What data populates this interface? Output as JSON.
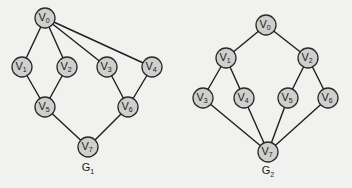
{
  "colors": {
    "background": "#f1f1ef",
    "node_fill": "#cfcfcd",
    "node_stroke": "#2a2a2a",
    "edge": "#1e1e1e"
  },
  "graphs": [
    {
      "id": "G1",
      "label": {
        "base": "G",
        "sub": "1",
        "x": 88,
        "y": 171
      },
      "nodes": [
        {
          "id": "V0",
          "base": "V",
          "sub": "0",
          "x": 45,
          "y": 18
        },
        {
          "id": "V1",
          "base": "V",
          "sub": "1",
          "x": 22,
          "y": 67
        },
        {
          "id": "V2",
          "base": "V",
          "sub": "2",
          "x": 67,
          "y": 67
        },
        {
          "id": "V3",
          "base": "V",
          "sub": "3",
          "x": 107,
          "y": 67
        },
        {
          "id": "V4",
          "base": "V",
          "sub": "4",
          "x": 152,
          "y": 67
        },
        {
          "id": "V5",
          "base": "V",
          "sub": "5",
          "x": 45,
          "y": 107
        },
        {
          "id": "V6",
          "base": "V",
          "sub": "6",
          "x": 128,
          "y": 107
        },
        {
          "id": "V7",
          "base": "V",
          "sub": "7",
          "x": 88,
          "y": 147
        }
      ],
      "edges": [
        [
          "V0",
          "V1"
        ],
        [
          "V0",
          "V2"
        ],
        [
          "V0",
          "V3"
        ],
        [
          "V0",
          "V4"
        ],
        [
          "V1",
          "V5"
        ],
        [
          "V2",
          "V5"
        ],
        [
          "V3",
          "V6"
        ],
        [
          "V4",
          "V6"
        ],
        [
          "V5",
          "V7"
        ],
        [
          "V6",
          "V7"
        ]
      ]
    },
    {
      "id": "G2",
      "label": {
        "base": "G",
        "sub": "2",
        "x": 268,
        "y": 174
      },
      "nodes": [
        {
          "id": "V0",
          "base": "V",
          "sub": "0",
          "x": 266,
          "y": 25
        },
        {
          "id": "V1",
          "base": "V",
          "sub": "1",
          "x": 226,
          "y": 58
        },
        {
          "id": "V2",
          "base": "V",
          "sub": "2",
          "x": 308,
          "y": 58
        },
        {
          "id": "V3",
          "base": "V",
          "sub": "3",
          "x": 203,
          "y": 98
        },
        {
          "id": "V4",
          "base": "V",
          "sub": "4",
          "x": 244,
          "y": 98
        },
        {
          "id": "V5",
          "base": "V",
          "sub": "5",
          "x": 288,
          "y": 98
        },
        {
          "id": "V6",
          "base": "V",
          "sub": "6",
          "x": 328,
          "y": 98
        },
        {
          "id": "V7",
          "base": "V",
          "sub": "7",
          "x": 268,
          "y": 152
        }
      ],
      "edges": [
        [
          "V0",
          "V1"
        ],
        [
          "V0",
          "V2"
        ],
        [
          "V1",
          "V3"
        ],
        [
          "V1",
          "V4"
        ],
        [
          "V2",
          "V5"
        ],
        [
          "V2",
          "V6"
        ],
        [
          "V3",
          "V7"
        ],
        [
          "V4",
          "V7"
        ],
        [
          "V5",
          "V7"
        ],
        [
          "V6",
          "V7"
        ]
      ]
    }
  ]
}
